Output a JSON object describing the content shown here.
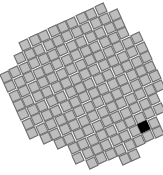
{
  "board": {
    "origin": [
      80,
      88
    ],
    "pitch": 10.4,
    "angle_deg": -25,
    "tile_size": 10,
    "colors": {
      "tile_fill": "#bdbdbd",
      "tile_border": "#6e6e6e",
      "marked_fill": "#000000",
      "background": "#ffffff"
    },
    "outline": [
      [
        97,
        6
      ],
      [
        124,
        18
      ],
      [
        136,
        34
      ],
      [
        150,
        58
      ],
      [
        160,
        88
      ],
      [
        162,
        124
      ],
      [
        158,
        142
      ],
      [
        132,
        156
      ],
      [
        106,
        167
      ],
      [
        94,
        164
      ],
      [
        72,
        157
      ],
      [
        30,
        132
      ],
      [
        3,
        96
      ],
      [
        1,
        76
      ],
      [
        18,
        56
      ],
      [
        28,
        40
      ],
      [
        58,
        26
      ],
      [
        97,
        6
      ]
    ],
    "marked_cells": [
      [
        148,
        130
      ]
    ]
  }
}
